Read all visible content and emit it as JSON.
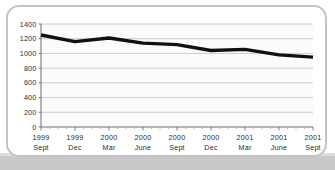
{
  "chart_data": {
    "type": "line",
    "title": "",
    "subtitle": "",
    "xlabel": "",
    "ylabel": "",
    "ylim": [
      0,
      1400
    ],
    "ytick_step": 200,
    "yticks": [
      "0",
      "200",
      "400",
      "600",
      "800",
      "1000",
      "1200",
      "1400"
    ],
    "grid": true,
    "legend": "none",
    "line_color": "#111111",
    "grid_color": "#c0c0c0",
    "axis_color": "#6e6e6e",
    "plot_background": "#fbfbfb",
    "minor_ticks_per_interval": 3,
    "categories": [
      "1999 Sept",
      "1999 Dec",
      "2000 Mar",
      "2000 June",
      "2000 Sept",
      "2000 Dec",
      "2001 Mar",
      "2001 June",
      "2001 Sept"
    ],
    "xtick_labels": [
      {
        "year": "1999",
        "month": "Sept"
      },
      {
        "year": "1999",
        "month": "Dec"
      },
      {
        "year": "2000",
        "month": "Mar"
      },
      {
        "year": "2000",
        "month": "June"
      },
      {
        "year": "2000",
        "month": "Sept"
      },
      {
        "year": "2000",
        "month": "Dec"
      },
      {
        "year": "2001",
        "month": "Mar"
      },
      {
        "year": "2001",
        "month": "June"
      },
      {
        "year": "2001",
        "month": "Sept"
      }
    ],
    "series": [
      {
        "name": "series-1",
        "values": [
          1250,
          1160,
          1210,
          1140,
          1120,
          1040,
          1055,
          980,
          950
        ]
      }
    ]
  }
}
